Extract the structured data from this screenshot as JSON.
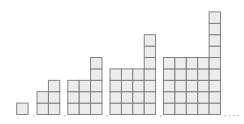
{
  "diagram": {
    "colors": {
      "cell_fill": "#ececec",
      "cell_stroke": "#7a7a7a",
      "separator": "#555555",
      "background": "#ffffff"
    },
    "cell_size": 11.4,
    "baseline_y": 114.5,
    "figures": [
      {
        "index": 1,
        "x": 16.7,
        "columns": [
          1
        ]
      },
      {
        "index": 2,
        "x": 37.0,
        "columns": [
          2,
          3
        ]
      },
      {
        "index": 3,
        "x": 67.8,
        "columns": [
          3,
          3,
          5
        ]
      },
      {
        "index": 4,
        "x": 110.0,
        "columns": [
          4,
          4,
          4,
          7
        ]
      },
      {
        "index": 5,
        "x": 163.5,
        "columns": [
          5,
          5,
          5,
          5,
          9
        ]
      }
    ],
    "separators": [
      {
        "x": 33,
        "y": 114,
        "text": ","
      },
      {
        "x": 64,
        "y": 114,
        "text": ","
      },
      {
        "x": 106,
        "y": 114,
        "text": ","
      },
      {
        "x": 160,
        "y": 114,
        "text": ","
      }
    ],
    "continuation": {
      "x": 224,
      "y": 114,
      "text": ", . . ."
    }
  }
}
